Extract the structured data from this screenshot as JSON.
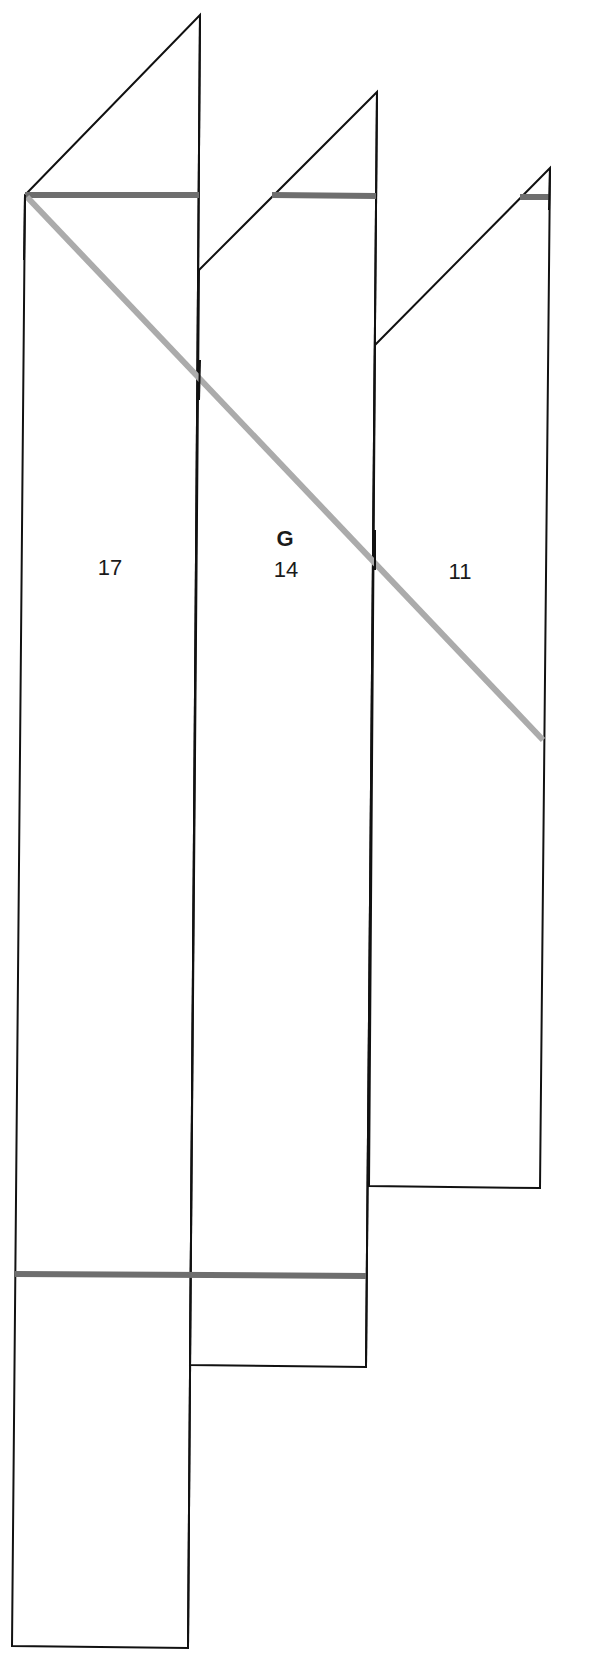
{
  "diagram": {
    "group_label": "G",
    "columns": [
      {
        "id": "col-1",
        "label": "17"
      },
      {
        "id": "col-2",
        "label": "14"
      },
      {
        "id": "col-3",
        "label": "11"
      }
    ],
    "colors": {
      "outline": "#111111",
      "dark_bar": "#6e6e6e",
      "light_diagonal": "#ababab",
      "background": "#ffffff"
    }
  }
}
